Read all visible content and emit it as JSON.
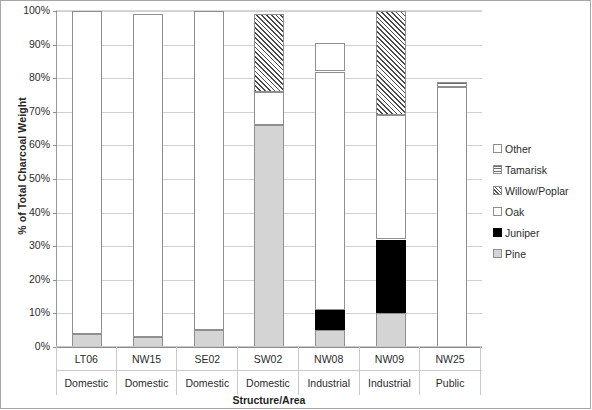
{
  "chart_data": {
    "type": "bar",
    "subtype": "stacked-bar-100",
    "title": "",
    "xlabel": "Structure/Area",
    "ylabel": "% of Total Charcoal Weight",
    "ylim": [
      0,
      100
    ],
    "ytick_labels": [
      "0%",
      "10%",
      "20%",
      "30%",
      "40%",
      "50%",
      "60%",
      "70%",
      "80%",
      "90%",
      "100%"
    ],
    "ytick_values": [
      0,
      10,
      20,
      30,
      40,
      50,
      60,
      70,
      80,
      90,
      100
    ],
    "grid": true,
    "legend_position": "right",
    "categories": [
      "LT06",
      "NW15",
      "SE02",
      "SW02",
      "NW08",
      "NW09",
      "NW25"
    ],
    "category_groups": [
      "Domestic",
      "Domestic",
      "Domestic",
      "Domestic",
      "Industrial",
      "Industrial",
      "Public"
    ],
    "series": [
      {
        "name": "Pine",
        "pattern": "light-gray-fill",
        "values": [
          4,
          3,
          5,
          66,
          5,
          10,
          0
        ]
      },
      {
        "name": "Juniper",
        "pattern": "solid-black",
        "values": [
          0,
          0,
          0,
          0,
          6,
          22,
          0
        ]
      },
      {
        "name": "Oak",
        "pattern": "white-fill",
        "values": [
          96,
          96,
          95,
          10,
          71,
          37,
          77.5
        ]
      },
      {
        "name": "Willow/Poplar",
        "pattern": "diagonal-hatch",
        "values": [
          0,
          0,
          0,
          23,
          0,
          31,
          0
        ]
      },
      {
        "name": "Tamarisk",
        "pattern": "horizontal-stripes",
        "values": [
          0,
          0,
          0,
          0,
          0,
          0,
          1.5
        ]
      },
      {
        "name": "Other",
        "pattern": "light-stipple",
        "values": [
          0,
          0,
          0,
          0,
          8.5,
          0,
          0
        ]
      }
    ],
    "bar_totals": [
      100,
      99,
      100,
      99,
      90.5,
      100,
      79
    ]
  },
  "legend": {
    "items": [
      {
        "label": "Other",
        "swatch": "other-swatch"
      },
      {
        "label": "Tamarisk",
        "swatch": "tamarisk-swatch"
      },
      {
        "label": "Willow/Poplar",
        "swatch": "willow-poplar-swatch"
      },
      {
        "label": "Oak",
        "swatch": "oak-swatch"
      },
      {
        "label": "Juniper",
        "swatch": "juniper-swatch"
      },
      {
        "label": "Pine",
        "swatch": "pine-swatch"
      }
    ]
  },
  "colors": {
    "pine": "#d4d4d4",
    "juniper": "#000000",
    "oak": "#ffffff",
    "willow_poplar": "#4a4a4a",
    "tamarisk": "#6e6e6e",
    "other": "#c8c8c8",
    "gridline": "#d0d0d0",
    "axis": "#8c8c8c",
    "text": "#262626"
  }
}
